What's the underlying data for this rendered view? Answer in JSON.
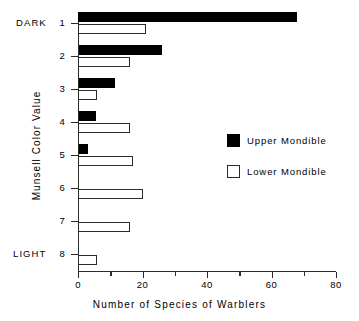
{
  "chart_data": {
    "type": "bar",
    "orientation": "horizontal",
    "title": "",
    "xlabel": "Number of Species of Warblers",
    "ylabel": "Munsell Color Value",
    "xlim": [
      0,
      80
    ],
    "ylim_categories": [
      "1",
      "2",
      "3",
      "4",
      "5",
      "6",
      "7",
      "8"
    ],
    "x_ticks_major": [
      0,
      20,
      40,
      60,
      80
    ],
    "x_ticks_minor": [
      10,
      30,
      50,
      70
    ],
    "x_tick_labels": [
      "0",
      "20",
      "40",
      "60",
      "80"
    ],
    "grid": false,
    "legend_position": "center-right",
    "y_axis_end_labels": {
      "top": "DARK",
      "bottom": "LIGHT"
    },
    "categories": [
      "1",
      "2",
      "3",
      "4",
      "5",
      "6",
      "7",
      "8"
    ],
    "series": [
      {
        "name": "Upper Mondible",
        "color": "#000000",
        "fill": "solid",
        "values": [
          68,
          26,
          11.5,
          5.5,
          3,
          0,
          0,
          0
        ]
      },
      {
        "name": "Lower Mondible",
        "color": "#ffffff",
        "fill": "hollow",
        "values": [
          21,
          16,
          6,
          16,
          17,
          20,
          16,
          6
        ]
      }
    ]
  },
  "axes": {
    "y_title": "Munsell Color Value",
    "x_title": "Number of Species of Warblers",
    "y_labels": [
      "1",
      "2",
      "3",
      "4",
      "5",
      "6",
      "7",
      "8"
    ],
    "y_dark_label": "DARK",
    "y_light_label": "LIGHT",
    "x_labels": [
      "0",
      "20",
      "40",
      "60",
      "80"
    ]
  },
  "legend": {
    "items": [
      {
        "label": "Upper Mondible",
        "swatch": "filled-square-icon"
      },
      {
        "label": "Lower Mondible",
        "swatch": "hollow-square-icon"
      }
    ]
  }
}
